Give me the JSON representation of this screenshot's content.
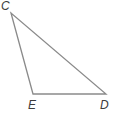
{
  "figure": {
    "kind": "geometry-diagram",
    "shape_name": "triangle",
    "background_color": "#ffffff",
    "stroke_color": "#8a8a8a",
    "stroke_width": 1.3,
    "label_color": "#3c3c3c",
    "label_style": "italic",
    "width": 119,
    "height": 121,
    "vertices": [
      {
        "id": "C",
        "label": "C",
        "x": 11,
        "y": 13,
        "label_x": 1,
        "label_y": 0,
        "position": "top-left-apex"
      },
      {
        "id": "E",
        "label": "E",
        "x": 33,
        "y": 94,
        "label_x": 28,
        "label_y": 99,
        "position": "bottom-left"
      },
      {
        "id": "D",
        "label": "D",
        "x": 106,
        "y": 94,
        "label_x": 100,
        "label_y": 99,
        "position": "bottom-right"
      }
    ],
    "edges": [
      {
        "id": "CE",
        "from": "C",
        "to": "E",
        "name": "side-c-e"
      },
      {
        "id": "ED",
        "from": "E",
        "to": "D",
        "name": "side-e-d"
      },
      {
        "id": "DC",
        "from": "D",
        "to": "C",
        "name": "side-d-c"
      }
    ]
  },
  "chart_data": {
    "type": "scatter",
    "title": "",
    "xlabel": "",
    "ylabel": "",
    "annotations": [
      "C",
      "E",
      "D"
    ],
    "points": [
      {
        "label": "C",
        "x": 11,
        "y": 13
      },
      {
        "label": "E",
        "x": 33,
        "y": 94
      },
      {
        "label": "D",
        "x": 106,
        "y": 94
      }
    ]
  }
}
